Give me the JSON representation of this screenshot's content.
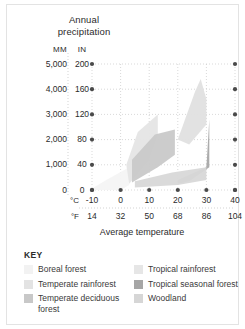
{
  "chart_data": {
    "type": "area",
    "title": "Annual precipitation",
    "xlabel": "Average temperature",
    "ylabel": "Annual precipitation",
    "grid": true,
    "legend_position": "below",
    "axes": {
      "y_primary_unit": "MM",
      "y_secondary_unit": "IN",
      "y_primary_ticks": [
        "0",
        "1,000",
        "2,000",
        "3,000",
        "4,000",
        "5,000"
      ],
      "y_secondary_ticks": [
        "0",
        "40",
        "80",
        "120",
        "160",
        "200"
      ],
      "ylim_mm": [
        0,
        5000
      ],
      "ylim_in": [
        0,
        200
      ],
      "x_primary_unit": "°C",
      "x_secondary_unit": "°F",
      "x_primary_ticks": [
        "-10",
        "0",
        "10",
        "20",
        "30",
        "40"
      ],
      "x_secondary_ticks": [
        "14",
        "32",
        "50",
        "68",
        "86",
        "104"
      ],
      "xlim_c": [
        -10,
        40
      ],
      "xlim_f": [
        14,
        104
      ]
    },
    "series": [
      {
        "name": "Boreal forest",
        "color": "#f4f4f4",
        "polygon_c_mm": [
          [
            -10,
            0
          ],
          [
            0,
            0
          ],
          [
            3,
            200
          ],
          [
            3,
            900
          ],
          [
            -5,
            400
          ],
          [
            -10,
            60
          ]
        ]
      },
      {
        "name": "Temperate rainforest",
        "color": "#e5e5e5",
        "polygon_c_mm": [
          [
            3,
            250
          ],
          [
            10,
            1200
          ],
          [
            13,
            2200
          ],
          [
            13,
            3000
          ],
          [
            6,
            2300
          ],
          [
            2,
            1000
          ]
        ]
      },
      {
        "name": "Temperate deciduous forest",
        "color": "#c9c9c9",
        "polygon_c_mm": [
          [
            4,
            300
          ],
          [
            13,
            900
          ],
          [
            19,
            1400
          ],
          [
            19,
            2400
          ],
          [
            12,
            2200
          ],
          [
            4,
            1200
          ]
        ]
      },
      {
        "name": "Tropical rainforest",
        "color": "#e0e0e0",
        "polygon_c_mm": [
          [
            20,
            2000
          ],
          [
            26,
            3900
          ],
          [
            28,
            4400
          ],
          [
            30,
            3600
          ],
          [
            30,
            2600
          ],
          [
            24,
            1800
          ]
        ]
      },
      {
        "name": "Tropical seasonal forest",
        "color": "#a8a8a8",
        "polygon_c_mm": [
          [
            20,
            400
          ],
          [
            30,
            900
          ],
          [
            31,
            2800
          ],
          [
            31,
            900
          ],
          [
            24,
            350
          ],
          [
            20,
            250
          ]
        ]
      },
      {
        "name": "Woodland",
        "color": "#d8d8d8",
        "polygon_c_mm": [
          [
            5,
            100
          ],
          [
            20,
            200
          ],
          [
            30,
            400
          ],
          [
            30,
            900
          ],
          [
            18,
            700
          ],
          [
            5,
            350
          ]
        ]
      }
    ]
  },
  "title": {
    "line1": "Annual",
    "line2": "precipitation"
  },
  "units": {
    "mm": "MM",
    "in": "IN"
  },
  "y_axis": {
    "ticks": [
      {
        "mm": "5,000",
        "in": "200"
      },
      {
        "mm": "4,000",
        "in": "160"
      },
      {
        "mm": "3,000",
        "in": "120"
      },
      {
        "mm": "2,000",
        "in": "80"
      },
      {
        "mm": "1,000",
        "in": "40"
      },
      {
        "mm": "0",
        "in": "0"
      }
    ]
  },
  "x_axis": {
    "celsius_label": "°C",
    "fahrenheit_label": "°F",
    "celsius": [
      "-10",
      "0",
      "10",
      "20",
      "30",
      "40"
    ],
    "fahrenheit": [
      "14",
      "32",
      "50",
      "68",
      "86",
      "104"
    ],
    "title": "Average temperature"
  },
  "key": {
    "heading": "KEY",
    "left": [
      {
        "label": "Boreal forest",
        "color": "#f2f2f2"
      },
      {
        "label": "Temperate rainforest",
        "color": "#e3e3e3"
      },
      {
        "label": "Temperate deciduous forest",
        "color": "#c8c8c8"
      }
    ],
    "right": [
      {
        "label": "Tropical rainforest",
        "color": "#e6e6e6"
      },
      {
        "label": "Tropical seasonal forest",
        "color": "#a6a6a6"
      },
      {
        "label": "Woodland",
        "color": "#d6d6d6"
      }
    ]
  }
}
